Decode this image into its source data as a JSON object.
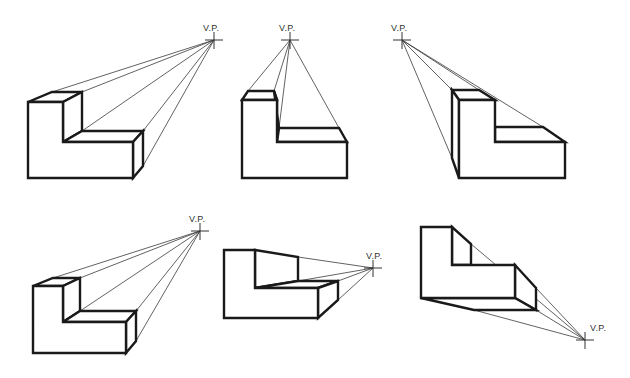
{
  "vp_label": "V.P.",
  "colors": {
    "line": "#1a1a1a",
    "projector": "#3a3a3a",
    "background": "#ffffff"
  },
  "figures": [
    {
      "id": "fig-1",
      "vp": [
        214,
        40
      ],
      "label_pos": [
        203,
        31
      ],
      "front": [
        [
          28,
          102
        ],
        [
          63,
          102
        ],
        [
          63,
          142
        ],
        [
          133,
          142
        ],
        [
          133,
          178
        ],
        [
          28,
          178
        ]
      ],
      "hidden_faces": [
        [
          [
            28,
            102
          ],
          [
            52,
            92
          ],
          [
            82,
            92
          ],
          [
            63,
            102
          ]
        ],
        [
          [
            63,
            102
          ],
          [
            82,
            92
          ],
          [
            82,
            131
          ],
          [
            63,
            142
          ]
        ],
        [
          [
            63,
            142
          ],
          [
            82,
            131
          ],
          [
            143,
            131
          ],
          [
            133,
            142
          ]
        ],
        [
          [
            133,
            142
          ],
          [
            143,
            131
          ],
          [
            143,
            166
          ],
          [
            133,
            178
          ]
        ]
      ],
      "projectors": [
        [
          52,
          92
        ],
        [
          82,
          92
        ],
        [
          82,
          131
        ],
        [
          143,
          131
        ],
        [
          143,
          166
        ]
      ]
    },
    {
      "id": "fig-2",
      "vp": [
        290,
        40
      ],
      "label_pos": [
        279,
        31
      ],
      "front": [
        [
          242,
          100
        ],
        [
          277,
          100
        ],
        [
          277,
          142
        ],
        [
          347,
          142
        ],
        [
          347,
          178
        ],
        [
          242,
          178
        ]
      ],
      "hidden_faces": [
        [
          [
            242,
            100
          ],
          [
            248,
            91
          ],
          [
            274,
            91
          ],
          [
            277,
            100
          ]
        ],
        [
          [
            277,
            100
          ],
          [
            274,
            91
          ],
          [
            279,
            128
          ],
          [
            277,
            142
          ]
        ],
        [
          [
            277,
            142
          ],
          [
            279,
            128
          ],
          [
            339,
            128
          ],
          [
            347,
            142
          ]
        ]
      ],
      "projectors": [
        [
          248,
          91
        ],
        [
          274,
          91
        ],
        [
          279,
          128
        ],
        [
          339,
          128
        ]
      ]
    },
    {
      "id": "fig-3",
      "vp": [
        402,
        40
      ],
      "label_pos": [
        391,
        31
      ],
      "front": [
        [
          459,
          100
        ],
        [
          495,
          100
        ],
        [
          495,
          142
        ],
        [
          565,
          142
        ],
        [
          565,
          178
        ],
        [
          459,
          178
        ]
      ],
      "hidden_faces": [
        [
          [
            459,
            100
          ],
          [
            452,
            90
          ],
          [
            479,
            90
          ],
          [
            495,
            100
          ]
        ],
        [
          [
            459,
            100
          ],
          [
            452,
            90
          ],
          [
            452,
            158
          ],
          [
            459,
            178
          ]
        ],
        [
          [
            495,
            142
          ],
          [
            495,
            127
          ],
          [
            543,
            127
          ],
          [
            565,
            142
          ]
        ]
      ],
      "projectors": [
        [
          452,
          90
        ],
        [
          479,
          90
        ],
        [
          543,
          127
        ],
        [
          452,
          158
        ]
      ]
    },
    {
      "id": "fig-4",
      "vp": [
        200,
        231
      ],
      "label_pos": [
        189,
        222
      ],
      "front": [
        [
          33,
          286
        ],
        [
          63,
          286
        ],
        [
          63,
          322
        ],
        [
          126,
          322
        ],
        [
          126,
          353
        ],
        [
          33,
          353
        ]
      ],
      "hidden_faces": [
        [
          [
            33,
            286
          ],
          [
            53,
            278
          ],
          [
            80,
            278
          ],
          [
            63,
            286
          ]
        ],
        [
          [
            63,
            286
          ],
          [
            80,
            278
          ],
          [
            80,
            311
          ],
          [
            63,
            322
          ]
        ],
        [
          [
            63,
            322
          ],
          [
            80,
            311
          ],
          [
            136,
            311
          ],
          [
            126,
            322
          ]
        ],
        [
          [
            126,
            322
          ],
          [
            136,
            311
          ],
          [
            136,
            341
          ],
          [
            126,
            353
          ]
        ]
      ],
      "projectors": [
        [
          53,
          278
        ],
        [
          80,
          278
        ],
        [
          80,
          311
        ],
        [
          136,
          311
        ],
        [
          136,
          341
        ]
      ]
    },
    {
      "id": "fig-5",
      "vp": [
        373,
        268
      ],
      "label_pos": [
        366,
        259
      ],
      "front": [
        [
          224,
          250
        ],
        [
          255,
          250
        ],
        [
          255,
          288
        ],
        [
          318,
          288
        ],
        [
          318,
          318
        ],
        [
          224,
          318
        ]
      ],
      "hidden_faces": [
        [
          [
            255,
            250
          ],
          [
            298,
            257
          ],
          [
            298,
            281
          ],
          [
            255,
            288
          ]
        ],
        [
          [
            255,
            288
          ],
          [
            298,
            281
          ],
          [
            338,
            281
          ],
          [
            318,
            288
          ]
        ],
        [
          [
            318,
            288
          ],
          [
            338,
            281
          ],
          [
            338,
            300
          ],
          [
            318,
            318
          ]
        ]
      ],
      "projectors": [
        [
          298,
          257
        ],
        [
          298,
          281
        ],
        [
          338,
          281
        ],
        [
          338,
          300
        ]
      ]
    },
    {
      "id": "fig-6",
      "vp": [
        585,
        340
      ],
      "label_pos": [
        590,
        331
      ],
      "front": [
        [
          421,
          227
        ],
        [
          452,
          227
        ],
        [
          452,
          265
        ],
        [
          515,
          265
        ],
        [
          515,
          298
        ],
        [
          421,
          298
        ]
      ],
      "hidden_faces": [
        [
          [
            452,
            227
          ],
          [
            471,
            244
          ],
          [
            471,
            265
          ],
          [
            452,
            265
          ]
        ],
        [
          [
            515,
            265
          ],
          [
            536,
            288
          ],
          [
            536,
            310
          ],
          [
            515,
            298
          ]
        ],
        [
          [
            421,
            298
          ],
          [
            515,
            298
          ],
          [
            536,
            310
          ],
          [
            474,
            310
          ]
        ]
      ],
      "projectors": [
        [
          471,
          244
        ],
        [
          536,
          288
        ],
        [
          536,
          310
        ],
        [
          474,
          310
        ]
      ]
    }
  ]
}
